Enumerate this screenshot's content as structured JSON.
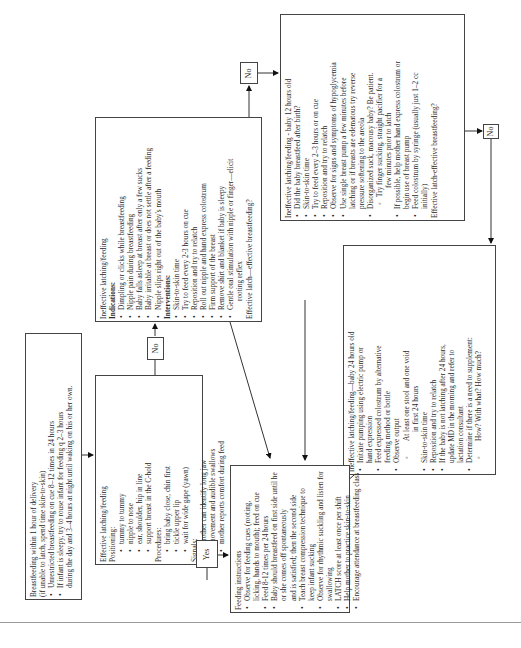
{
  "diagram": {
    "orientation": "rotated-90-ccw",
    "box_start": {
      "title": "Breastfeeding within 1 hour of delivery",
      "subtitle": "(if unable to latch, spend time skin-to-skin)",
      "items": [
        "Unrestricted breastfeeding on cue 8–12 times in 24 hours",
        "If infant is sleepy, try to rouse infant for feeding q 2–3 hours",
        "during the day and 3–4 hours at night until waking on his or her own."
      ]
    },
    "box_effective": {
      "title": "Effective latching/feeding",
      "positioning_label": "Positioning:",
      "positioning": [
        "tummy to tummy",
        "nipple to nose",
        "ear, shoulder, hip in line",
        "support breast in the C-hold"
      ],
      "procedures_label": "Procedures:",
      "procedures": [
        "bring baby close, chin first",
        "tickle upper lip",
        "wait for wide gape (yawn)"
      ],
      "signals_label": "Signals:",
      "signals": [
        "mother can identify long jaw",
        "movement and audible swallows",
        "mother reports comfort during feed"
      ]
    },
    "box_ineffective": {
      "title": "Ineffective latching/feeding",
      "indications_label": "Indications:",
      "indications": [
        "Dimpling or clicks while breastfeeding",
        "Nipple pain during breastfeeding",
        "Baby falls asleep at breast after only a few sucks",
        "Baby irritable at breast or does not settle after a feeding",
        "Nipple slips right out of the baby's mouth"
      ],
      "interventions_label": "Interventions:",
      "interventions": [
        "Skin-to-skin time",
        "Try to feed every 2-3 hours on cue",
        "Reposition and try to relatch",
        "Roll out nipple and hand express colostrum",
        "Firm support of the breast",
        "Remove shirt and blanket if baby is sleepy",
        "Gentle oral stimulation with nipple or finger—elicit",
        "rooting reflex"
      ],
      "question": "Effective latch—effective breastfeeding?"
    },
    "box_12h": {
      "title": "Ineffective latching/feeding - baby 12 hours old",
      "items": [
        "Did the baby breastfeed after birth?",
        "Skin-to-skin time",
        "Try to feed every 2–3 hours or on cue",
        "Reposition and try to relatch",
        "Observe for signs and symptoms of hypoglycemia",
        "Use single breast pump a few minutes before",
        "latching or if breasts are edematous try reverse",
        "pressure softening to the areola",
        "Disorganized suck, macousy baby? Be patient.",
        "Try finger sucking, straight pacifier for a",
        "few minutes prior to latch",
        "If possible, help mother hand express colostrum or",
        "begin use of breast pump",
        "Feed colostrum by syringe (usually just 1–2 cc",
        "initially)"
      ],
      "question": "Effective latch-effective breastfeeding?"
    },
    "box_24h": {
      "title": "Ineffective latching/feeding—baby 24 hours old",
      "items": [
        "Initiate pumping using electric pump or",
        "hand expression",
        "Feed expressed colostrum by alternative",
        "feeding method or bottle",
        "Observe output",
        "At least one stool and one void",
        "in first 24 hours",
        "Skin-to-skin time",
        "Reposition and try to relatch",
        "If the baby is not latching after 24 hours,",
        "update MD in the morning and refer to",
        "lactation consultant",
        "Determine if there is a need to supplement:",
        "How? With what? How much?"
      ]
    },
    "box_instructions": {
      "title": "Feeding instructions",
      "items": [
        "Observe for feeding cues (rooting,",
        "licking, hands to mouth); feed on cue",
        "Feed 8-12 times per 24 hours",
        "Baby should breastfeed on first side until he",
        "or she comes off spontaneously",
        "and is satisfied; then the second side",
        "Teach breast compression technique to",
        "keep infant sucking",
        "Observe for rhythmic suckling and listen for",
        "swallowing",
        "LATCH score at least once per shift",
        "Help mother to practice skin-to-skin",
        "Encourage attendance at breastfeeding class"
      ]
    },
    "decisions": {
      "no_1": "No",
      "no_2": "No",
      "no_3": "No",
      "yes": "Yes"
    }
  }
}
